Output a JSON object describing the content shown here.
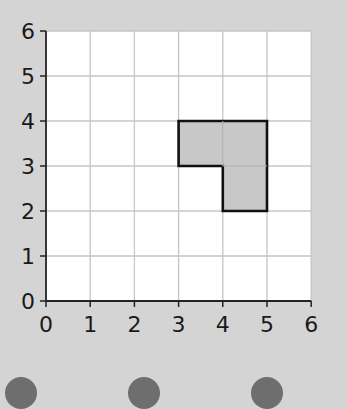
{
  "chart_data": {
    "type": "grid-shape",
    "title": "",
    "xlabel": "",
    "ylabel": "",
    "xlim": [
      0,
      6
    ],
    "ylim": [
      0,
      6
    ],
    "x_ticks": [
      "0",
      "1",
      "2",
      "3",
      "4",
      "5",
      "6"
    ],
    "y_ticks": [
      "0",
      "1",
      "2",
      "3",
      "4",
      "5",
      "6"
    ],
    "grid": true,
    "shape": {
      "name": "L-shaped polygon",
      "vertices": [
        [
          3,
          4
        ],
        [
          5,
          4
        ],
        [
          5,
          2
        ],
        [
          4,
          2
        ],
        [
          4,
          3
        ],
        [
          3,
          3
        ]
      ],
      "fill": "#c8c8c8",
      "stroke": "#111111"
    }
  },
  "colors": {
    "background": "#d4d4d4",
    "plot_bg": "#ffffff",
    "grid": "#c6c6c6",
    "axis": "#222222",
    "bubble": "#6e6e6e"
  },
  "answer_options": [
    {
      "id": "a"
    },
    {
      "id": "b"
    },
    {
      "id": "c"
    }
  ]
}
